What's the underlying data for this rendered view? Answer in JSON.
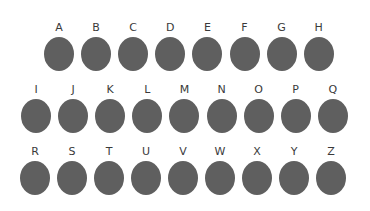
{
  "dot_color": "#5f5f5f",
  "rows": [
    {
      "y": 22,
      "start_x": 43,
      "step": 37.1,
      "letters": [
        "A",
        "B",
        "C",
        "D",
        "E",
        "F",
        "G",
        "H"
      ]
    },
    {
      "y": 84,
      "start_x": 20,
      "step": 37.1,
      "letters": [
        "I",
        "J",
        "K",
        "L",
        "M",
        "N",
        "O",
        "P",
        "Q"
      ]
    },
    {
      "y": 146,
      "start_x": 19,
      "step": 37.0,
      "letters": [
        "R",
        "S",
        "T",
        "U",
        "V",
        "W",
        "X",
        "Y",
        "Z"
      ]
    }
  ]
}
